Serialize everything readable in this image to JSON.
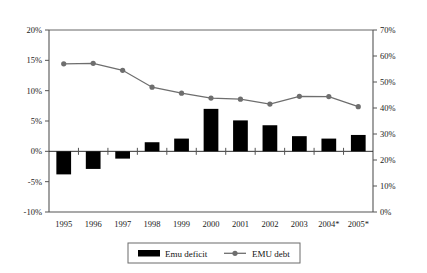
{
  "chart_data": {
    "type": "bar",
    "title": "",
    "subtitle": "",
    "xlabel": "",
    "ylabel": "",
    "categories": [
      "1995",
      "1996",
      "1997",
      "1998",
      "1999",
      "2000",
      "2001",
      "2002",
      "2003",
      "2004*",
      "2005*"
    ],
    "axes": {
      "left": {
        "label": "",
        "ylim": [
          -10,
          20
        ],
        "tick_step": 5,
        "ticks": [
          20,
          15,
          10,
          5,
          0,
          -5,
          -10
        ],
        "tick_labels": [
          "20%",
          "15%",
          "10%",
          "5%",
          "0%",
          "-5%",
          "-10%"
        ]
      },
      "right": {
        "label": "",
        "ylim": [
          0,
          70
        ],
        "tick_step": 10,
        "ticks": [
          70,
          60,
          50,
          40,
          30,
          20,
          10,
          0
        ],
        "tick_labels": [
          "70%",
          "60%",
          "50%",
          "40%",
          "30%",
          "20%",
          "10%",
          "0%"
        ]
      }
    },
    "grid": false,
    "legend_position": "bottom",
    "series": [
      {
        "name": "Emu deficit",
        "type": "bar",
        "axis": "left",
        "color": "#000000",
        "values": [
          -3.8,
          -2.9,
          -1.2,
          1.5,
          2.1,
          7.0,
          5.1,
          4.3,
          2.5,
          2.1,
          2.7
        ]
      },
      {
        "name": "EMU debt",
        "type": "line",
        "axis": "right",
        "color": "#6e6e6e",
        "marker": "circle",
        "values": [
          57.0,
          57.2,
          54.5,
          48.0,
          45.7,
          43.8,
          43.4,
          41.5,
          44.5,
          44.4,
          40.5
        ]
      }
    ]
  },
  "legend": {
    "items": [
      {
        "label": "Emu deficit",
        "marker": "filled-rect",
        "color": "#000000"
      },
      {
        "label": "EMU debt",
        "marker": "line-circle",
        "color": "#6e6e6e"
      }
    ]
  }
}
